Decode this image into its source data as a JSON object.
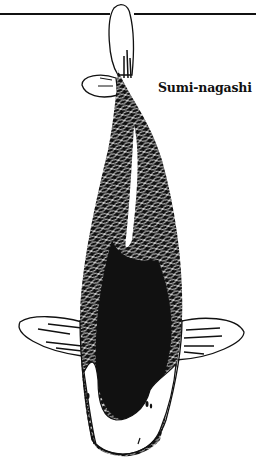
{
  "figure": {
    "variety_label": "Sumi-nagashi",
    "colors": {
      "ink": "#111111",
      "background": "#ffffff"
    }
  }
}
